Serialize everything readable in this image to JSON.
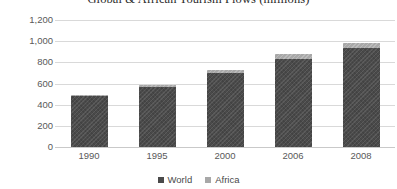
{
  "chart_data": {
    "type": "bar",
    "stacked": true,
    "title": "Global & African Tourism Flows (millions)",
    "xlabel": "",
    "ylabel": "",
    "categories": [
      "1990",
      "1995",
      "2000",
      "2006",
      "2008"
    ],
    "series": [
      {
        "name": "World",
        "color": "#4a4a4a",
        "values": [
          480,
          565,
          700,
          835,
          940
        ]
      },
      {
        "name": "Africa",
        "color": "#a8a8a8",
        "values": [
          15,
          20,
          27,
          40,
          47
        ]
      }
    ],
    "ylim": [
      0,
      1200
    ],
    "yticks": [
      0,
      200,
      400,
      600,
      800,
      1000,
      1200
    ],
    "ytick_labels": [
      "0",
      "200",
      "400",
      "600",
      "800",
      "1,000",
      "1,200"
    ],
    "grid": true,
    "legend_position": "bottom"
  },
  "legend": {
    "items": [
      {
        "label": "World",
        "swatch": "world"
      },
      {
        "label": "Africa",
        "swatch": "africa"
      }
    ]
  }
}
